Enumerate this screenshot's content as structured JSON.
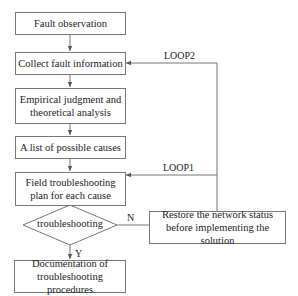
{
  "diagram": {
    "type": "flowchart",
    "nodes": {
      "fault_observation": "Fault observation",
      "collect_info": "Collect fault information",
      "analysis_line1": "Empirical judgment and",
      "analysis_line2": "theoretical analysis",
      "causes_list": "A list of possible causes",
      "plan_line1": "Field troubleshooting",
      "plan_line2": "plan for each cause",
      "decision": "troubleshooting",
      "restore_line1": "Restore the network status",
      "restore_line2": "before implementing the solution",
      "doc_line1": "Documentation of",
      "doc_line2": "troubleshooting procedures"
    },
    "edge_labels": {
      "yes": "Y",
      "no": "N",
      "loop1": "LOOP1",
      "loop2": "LOOP2"
    },
    "colors": {
      "line": "#777777",
      "text": "#222222",
      "background": "#ffffff"
    }
  }
}
